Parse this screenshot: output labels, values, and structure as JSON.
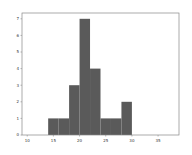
{
  "chart_data": {
    "type": "bar",
    "subtype": "histogram",
    "title": "",
    "xlabel": "",
    "ylabel": "",
    "bins": [
      {
        "start": 14,
        "end": 16,
        "count": 1
      },
      {
        "start": 16,
        "end": 18,
        "count": 1
      },
      {
        "start": 18,
        "end": 20,
        "count": 3
      },
      {
        "start": 20,
        "end": 22,
        "count": 7
      },
      {
        "start": 22,
        "end": 24,
        "count": 4
      },
      {
        "start": 24,
        "end": 26,
        "count": 1
      },
      {
        "start": 26,
        "end": 28,
        "count": 1
      },
      {
        "start": 28,
        "end": 30,
        "count": 2
      }
    ],
    "xlim": [
      9,
      39
    ],
    "ylim": [
      0,
      7.35
    ],
    "xticks": [
      10,
      15,
      20,
      25,
      30,
      35
    ],
    "yticks": [
      0,
      1,
      2,
      3,
      4,
      5,
      6,
      7
    ],
    "grid": false,
    "legend": null,
    "bar_color": "#5a5a5a",
    "frame_color": "#888888"
  }
}
